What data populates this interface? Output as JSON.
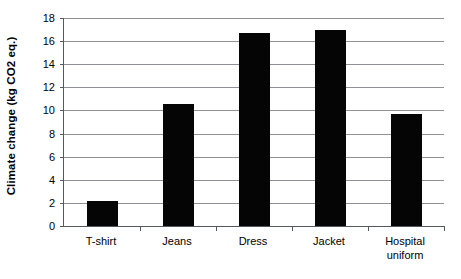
{
  "chart_data": {
    "type": "bar",
    "title": "",
    "xlabel": "",
    "ylabel": "Climate change (kg CO2 eq.)",
    "categories": [
      "T-shirt",
      "Jeans",
      "Dress",
      "Jacket",
      "Hospital uniform"
    ],
    "values": [
      2.2,
      10.6,
      16.7,
      17.0,
      9.7
    ],
    "ylim": [
      0,
      18
    ],
    "ytick_labels": [
      "0",
      "2",
      "4",
      "6",
      "8",
      "10",
      "12",
      "14",
      "16",
      "18"
    ],
    "ytick_values": [
      0,
      2,
      4,
      6,
      8,
      10,
      12,
      14,
      16,
      18
    ],
    "grid": true,
    "legend": "none",
    "bar_color": "#050505",
    "grid_color": "#8d9196",
    "axis_color": "#555a5f",
    "background_color": "#ffffff"
  },
  "axis": {
    "y_title": "Climate change (kg CO2 eq.)"
  },
  "x_labels": {
    "0": "T-shirt",
    "1": "Jeans",
    "2": "Dress",
    "3": "Jacket",
    "4": "Hospital\nuniform"
  }
}
